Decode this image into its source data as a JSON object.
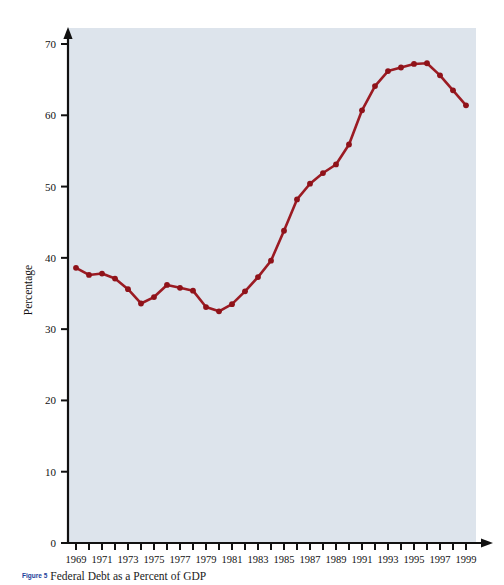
{
  "figure": {
    "number_label": "Figure 5",
    "caption": "Federal Debt as a Percent of GDP"
  },
  "colors": {
    "plot_background": "#dde4ec",
    "line": "#9b1b23",
    "marker": "#8f1219",
    "axis": "#111111",
    "page_background": "#ffffff",
    "caption_number": "#21409a"
  },
  "chart_data": {
    "type": "line",
    "title": "Federal Debt as a Percent of GDP",
    "xlabel": "",
    "ylabel": "Percentage",
    "xlim": [
      1969,
      1999
    ],
    "ylim": [
      0,
      70
    ],
    "grid": false,
    "legend": "none",
    "y_ticks": [
      0,
      10,
      20,
      30,
      40,
      50,
      60,
      70
    ],
    "y_tick_labels": [
      "0",
      "10",
      "20",
      "30",
      "40",
      "50",
      "60",
      "70"
    ],
    "x_ticks": [
      1969,
      1970,
      1971,
      1972,
      1973,
      1974,
      1975,
      1976,
      1977,
      1978,
      1979,
      1980,
      1981,
      1982,
      1983,
      1984,
      1985,
      1986,
      1987,
      1988,
      1989,
      1990,
      1991,
      1992,
      1993,
      1994,
      1995,
      1996,
      1997,
      1998,
      1999
    ],
    "x_tick_labels": [
      "1969",
      "1971",
      "1973",
      "1975",
      "1977",
      "1979",
      "1981",
      "1983",
      "1985",
      "1987",
      "1989",
      "1991",
      "1993",
      "1995",
      "1997",
      "1999"
    ],
    "x_tick_label_years": [
      1969,
      1971,
      1973,
      1975,
      1977,
      1979,
      1981,
      1983,
      1985,
      1987,
      1989,
      1991,
      1993,
      1995,
      1997,
      1999
    ],
    "x": [
      1969,
      1970,
      1971,
      1972,
      1973,
      1974,
      1975,
      1976,
      1977,
      1978,
      1979,
      1980,
      1981,
      1982,
      1983,
      1984,
      1985,
      1986,
      1987,
      1988,
      1989,
      1990,
      1991,
      1992,
      1993,
      1994,
      1995,
      1996,
      1997,
      1998,
      1999
    ],
    "values": [
      38.6,
      37.6,
      37.8,
      37.1,
      35.6,
      33.6,
      34.5,
      36.2,
      35.8,
      35.4,
      33.1,
      32.5,
      33.5,
      35.3,
      37.3,
      39.6,
      43.8,
      48.2,
      50.4,
      51.9,
      53.1,
      55.9,
      60.7,
      64.1,
      66.2,
      66.7,
      67.2,
      67.3,
      65.6,
      63.5,
      61.4
    ],
    "series": [
      {
        "name": "Federal debt as percent of GDP",
        "values": [
          38.6,
          37.6,
          37.8,
          37.1,
          35.6,
          33.6,
          34.5,
          36.2,
          35.8,
          35.4,
          33.1,
          32.5,
          33.5,
          35.3,
          37.3,
          39.6,
          43.8,
          48.2,
          50.4,
          51.9,
          53.1,
          55.9,
          60.7,
          64.1,
          66.2,
          66.7,
          67.2,
          67.3,
          65.6,
          63.5,
          61.4
        ],
        "color": "#9b1b23",
        "marker": "circle"
      }
    ]
  }
}
